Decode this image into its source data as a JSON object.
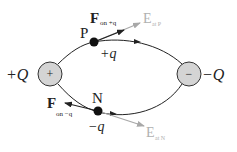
{
  "diagram": {
    "positive_charge": {
      "symbol": "+",
      "label": "+Q",
      "fill": "#d4d4d4"
    },
    "negative_charge": {
      "symbol": "−",
      "label": "−Q",
      "fill": "#d4d4d4"
    },
    "point_p": {
      "name": "P",
      "test_charge": "+q",
      "force_label_main": "F",
      "force_label_sub": "on +q",
      "field_label_main": "E",
      "field_label_sub": "at P"
    },
    "point_n": {
      "name": "N",
      "test_charge": "−q",
      "force_label_main": "F",
      "force_label_sub": "on −q",
      "field_label_main": "E",
      "field_label_sub": "at N"
    },
    "colors": {
      "line": "#222222",
      "field_vector": "#a8a8a8",
      "field_text": "#b0b0b0",
      "charge_fill": "#d4d4d4"
    }
  }
}
